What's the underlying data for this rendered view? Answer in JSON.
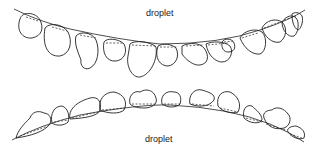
{
  "figure": {
    "labels": {
      "top": "droplet",
      "bottom": "droplet"
    },
    "panels": [
      {
        "name": "top-row",
        "description": "droplets hanging below a concave-down curved line",
        "droplet_count": 13
      },
      {
        "name": "bottom-row",
        "description": "droplets sitting on top of a convex curved line",
        "droplet_count": 11
      }
    ],
    "colors": {
      "stroke": "#222222",
      "background": "#ffffff"
    }
  }
}
